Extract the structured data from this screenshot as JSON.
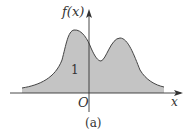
{
  "figure": {
    "y_axis_label": "f(x)",
    "x_axis_label": "x",
    "origin_label": "O",
    "area_label": "1",
    "caption": "(a)"
  },
  "colors": {
    "fill": "#c4c4c4",
    "stroke": "#444444",
    "axis": "#333333"
  }
}
